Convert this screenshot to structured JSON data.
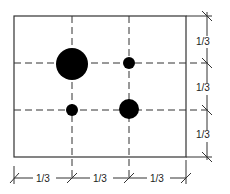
{
  "diagram": {
    "frame": {
      "x": 14,
      "y": 16,
      "width": 172,
      "height": 141
    },
    "grid_lines": {
      "vertical_x": [
        72,
        129
      ],
      "horizontal_y": [
        63,
        110
      ]
    },
    "points": [
      {
        "name": "large-dot",
        "cx": 72,
        "cy": 64,
        "r": 16
      },
      {
        "name": "small-dot-top-right",
        "cx": 129,
        "cy": 63,
        "r": 6
      },
      {
        "name": "small-dot-bottom-left",
        "cx": 72,
        "cy": 110,
        "r": 6
      },
      {
        "name": "medium-dot",
        "cx": 129,
        "cy": 109,
        "r": 10
      }
    ],
    "dimension_labels": {
      "right": [
        "1/3",
        "1/3",
        "1/3"
      ],
      "bottom": [
        "1/3",
        "1/3",
        "1/3"
      ]
    },
    "colors": {
      "stroke": "#222222",
      "fill": "#000000",
      "background": "#ffffff"
    }
  }
}
